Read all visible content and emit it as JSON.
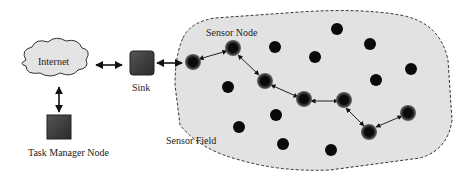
{
  "diagram": {
    "labels": {
      "internet": "Internet",
      "sink": "Sink",
      "task_manager": "Task Manager Node",
      "sensor_node": "Sensor Node",
      "sensor_field": "Sensor Field"
    },
    "colors": {
      "field_fill": "#e2e2e2",
      "node": "#0a0a0a",
      "active_halo": "#555555",
      "box": "#3c3c3c"
    }
  }
}
